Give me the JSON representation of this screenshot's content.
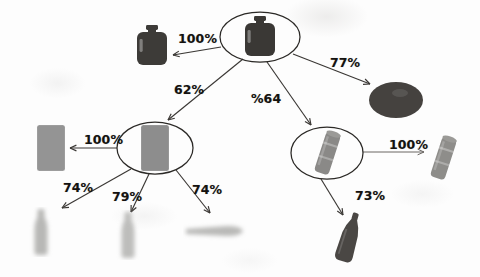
{
  "figure": {
    "type": "tree-diagram",
    "background_color": "#fdfdfd",
    "line_color": "#3a3734",
    "label_color": "#14120f"
  },
  "nodes": [
    {
      "id": "root",
      "name": "root-node-jug",
      "icon": "dark-jug-icon",
      "shape": "ellipse",
      "x": 260,
      "y": 37,
      "rx": 40,
      "ry": 25,
      "icon_kind": "jug-dark",
      "icon_color": "#3a3835"
    },
    {
      "id": "left",
      "name": "left-node-grey-block",
      "icon": "grey-block-icon",
      "shape": "ellipse",
      "x": 155,
      "y": 148,
      "rx": 38,
      "ry": 26,
      "icon_kind": "block-grey",
      "icon_color": "#8d8d8d"
    },
    {
      "id": "right",
      "name": "right-node-can",
      "icon": "tilted-can-icon",
      "shape": "ellipse",
      "x": 327,
      "y": 153,
      "rx": 36,
      "ry": 26,
      "icon_kind": "can-tilted",
      "icon_color": "#8a8987"
    }
  ],
  "leaves": [
    {
      "id": "leaf_jug",
      "name": "leaf-jug-dark",
      "icon_kind": "jug-dark",
      "x": 152,
      "y": 46,
      "icon_color": "#3d3b38"
    },
    {
      "id": "leaf_disc",
      "name": "leaf-disc-dark",
      "icon_kind": "disc-dark",
      "x": 396,
      "y": 100,
      "icon_color": "#45423f"
    },
    {
      "id": "leaf_block",
      "name": "leaf-block-grey",
      "icon_kind": "block-grey",
      "x": 51,
      "y": 148,
      "icon_color": "#949494"
    },
    {
      "id": "leaf_bottle_a",
      "name": "leaf-bottle-blur-a",
      "icon_kind": "bottle-blur",
      "x": 41,
      "y": 232,
      "icon_color": "#b8b8b6"
    },
    {
      "id": "leaf_bottle_b",
      "name": "leaf-bottle-blur-b",
      "icon_kind": "bottle-blur",
      "x": 128,
      "y": 235,
      "icon_color": "#bdbdbb"
    },
    {
      "id": "leaf_smear",
      "name": "leaf-smear-grey",
      "icon_kind": "smear-grey",
      "x": 215,
      "y": 231,
      "icon_color": "#b9b9b7"
    },
    {
      "id": "leaf_can",
      "name": "leaf-can-tilted",
      "icon_kind": "can-tilted",
      "x": 443,
      "y": 158,
      "icon_color": "#8e8d8a"
    },
    {
      "id": "leaf_bottle_dark",
      "name": "leaf-bottle-dark",
      "icon_kind": "bottle-dark",
      "x": 349,
      "y": 238,
      "icon_color": "#4a4744"
    }
  ],
  "edges": [
    {
      "id": "e1",
      "name": "edge-root-to-jug",
      "from": "root",
      "to": "leaf_jug",
      "label": "100%",
      "label_x": 178,
      "label_y": 31,
      "x1": 221,
      "y1": 47,
      "x2": 173,
      "y2": 55,
      "faint": false
    },
    {
      "id": "e2",
      "name": "edge-root-to-disc",
      "from": "root",
      "to": "leaf_disc",
      "label": "77%",
      "label_x": 330,
      "label_y": 55,
      "x1": 293,
      "y1": 54,
      "x2": 370,
      "y2": 84,
      "faint": false
    },
    {
      "id": "e3",
      "name": "edge-root-to-left-node",
      "from": "root",
      "to": "left",
      "label": "62%",
      "label_x": 174,
      "label_y": 82,
      "x1": 243,
      "y1": 59,
      "x2": 168,
      "y2": 120,
      "faint": false
    },
    {
      "id": "e4",
      "name": "edge-root-to-right-node",
      "from": "root",
      "to": "right",
      "label": "%64",
      "label_x": 251,
      "label_y": 91,
      "x1": 267,
      "y1": 62,
      "x2": 311,
      "y2": 125,
      "faint": false
    },
    {
      "id": "e5",
      "name": "edge-left-to-block",
      "from": "left",
      "to": "leaf_block",
      "label": "100%",
      "label_x": 84,
      "label_y": 132,
      "x1": 117,
      "y1": 148,
      "x2": 70,
      "y2": 148,
      "faint": false
    },
    {
      "id": "e6",
      "name": "edge-left-to-bottle-a",
      "from": "left",
      "to": "leaf_bottle_a",
      "label": "74%",
      "label_x": 63,
      "label_y": 180,
      "x1": 131,
      "y1": 169,
      "x2": 62,
      "y2": 208,
      "faint": false
    },
    {
      "id": "e7",
      "name": "edge-left-to-bottle-b",
      "from": "left",
      "to": "leaf_bottle_b",
      "label": "79%",
      "label_x": 112,
      "label_y": 189,
      "x1": 149,
      "y1": 174,
      "x2": 131,
      "y2": 212,
      "faint": false
    },
    {
      "id": "e8",
      "name": "edge-left-to-smear",
      "from": "left",
      "to": "leaf_smear",
      "label": "74%",
      "label_x": 192,
      "label_y": 182,
      "x1": 176,
      "y1": 170,
      "x2": 210,
      "y2": 213,
      "faint": false
    },
    {
      "id": "e9",
      "name": "edge-right-to-can",
      "from": "right",
      "to": "leaf_can",
      "label": "100%",
      "label_x": 389,
      "label_y": 137,
      "x1": 363,
      "y1": 152,
      "x2": 424,
      "y2": 152,
      "faint": true
    },
    {
      "id": "e10",
      "name": "edge-right-to-bottle-dark",
      "from": "right",
      "to": "leaf_bottle_dark",
      "label": "73%",
      "label_x": 355,
      "label_y": 188,
      "x1": 321,
      "y1": 179,
      "x2": 343,
      "y2": 215,
      "faint": false
    }
  ]
}
